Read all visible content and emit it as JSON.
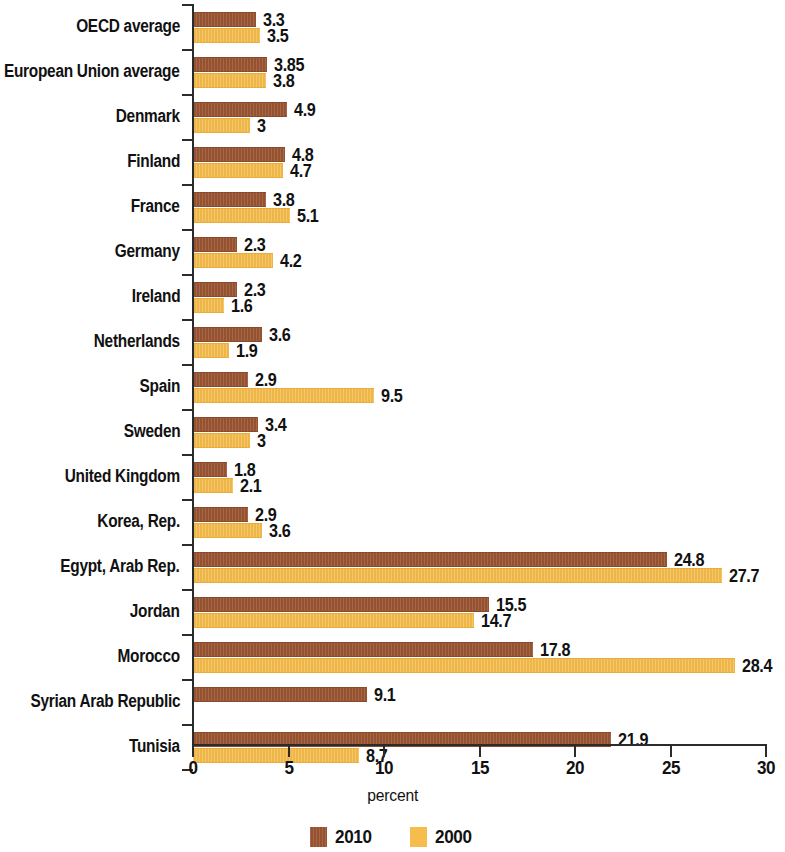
{
  "chart_data": {
    "type": "bar",
    "orientation": "horizontal",
    "title": "",
    "xlabel": "percent",
    "ylabel": "",
    "xlim": [
      0,
      30
    ],
    "xticks": [
      "0",
      "5",
      "10",
      "15",
      "20",
      "25",
      "30"
    ],
    "grid": false,
    "legend_position": "bottom-center",
    "categories": [
      "OECD average",
      "European Union average",
      "Denmark",
      "Finland",
      "France",
      "Germany",
      "Ireland",
      "Netherlands",
      "Spain",
      "Sweden",
      "United Kingdom",
      "Korea, Rep.",
      "Egypt, Arab Rep.",
      "Jordan",
      "Morocco",
      "Syrian Arab Republic",
      "Tunisia"
    ],
    "series": [
      {
        "name": "2010",
        "color": "#9c5633",
        "values": [
          3.3,
          3.85,
          4.9,
          4.8,
          3.8,
          2.3,
          2.3,
          3.6,
          2.9,
          3.4,
          1.8,
          2.9,
          24.8,
          15.5,
          17.8,
          9.1,
          21.9
        ],
        "labels": [
          "3.3",
          "3.85",
          "4.9",
          "4.8",
          "3.8",
          "2.3",
          "2.3",
          "3.6",
          "2.9",
          "3.4",
          "1.8",
          "2.9",
          "24.8",
          "15.5",
          "17.8",
          "9.1",
          "21.9"
        ]
      },
      {
        "name": "2000",
        "color": "#f6bd4e",
        "values": [
          3.5,
          3.8,
          3,
          4.7,
          5.1,
          4.2,
          1.6,
          1.9,
          9.5,
          3,
          2.1,
          3.6,
          27.7,
          14.7,
          28.4,
          null,
          8.7
        ],
        "labels": [
          "3.5",
          "3.8",
          "3",
          "4.7",
          "5.1",
          "4.2",
          "1.6",
          "1.9",
          "9.5",
          "3",
          "2.1",
          "3.6",
          "27.7",
          "14.7",
          "28.4",
          "",
          "8.7"
        ]
      }
    ]
  },
  "legend": {
    "items": [
      {
        "label": "2010",
        "color": "#9c5633"
      },
      {
        "label": "2000",
        "color": "#f6bd4e"
      }
    ]
  }
}
